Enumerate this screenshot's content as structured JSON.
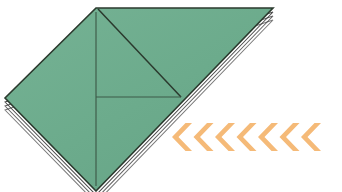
{
  "figure": {
    "kind": "origami-fold-diagram",
    "canvas": {
      "width": 342,
      "height": 192,
      "background": "#ffffff"
    },
    "colors": {
      "paper_front": "#6cab8c",
      "paper_front_shade": "#73b093",
      "paper_edge": "#2b3a2e",
      "crease_line": "#3d5a48",
      "layer_edge": "#3a3a3a",
      "layer_gap": "#ffffff",
      "arrow": "#f5ba78",
      "background": "#ffffff"
    },
    "paper": {
      "name": "folded-paper-shape",
      "outline_points": "96,8 273,8 96,191 5,98",
      "top_apex": {
        "x": 96,
        "y": 8
      },
      "right_tip": {
        "x": 273,
        "y": 8
      },
      "left_corner": {
        "x": 5,
        "y": 98
      },
      "bottom_tip": {
        "x": 96,
        "y": 191
      },
      "stroke_width": 1.6
    },
    "creases": [
      {
        "name": "vertical-center-crease",
        "type": "valley",
        "points": "96,12 96,186"
      },
      {
        "name": "diagonal-flap-crease",
        "type": "mountain",
        "points": "98,9 181,97"
      },
      {
        "name": "flap-lower-edge",
        "type": "edge",
        "points": "181,97 96,97"
      }
    ],
    "layers": {
      "name": "stacked-paper-layers",
      "count": 3,
      "left_offsets": [
        4,
        8,
        12
      ],
      "right_offsets": [
        4,
        8,
        12
      ]
    },
    "arrows": {
      "name": "fold-direction-arrows",
      "direction": "left",
      "count": 7,
      "label": "fold this way",
      "color": "#f5ba78",
      "start_x": 182,
      "center_y": 137,
      "spacing": 21.5,
      "half_width": 10,
      "half_height": 14,
      "thickness": 6.5
    }
  }
}
